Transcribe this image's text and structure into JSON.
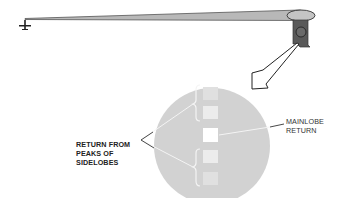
{
  "diagram": {
    "labels": {
      "sidelobe_return": "RETURN FROM\nPEAKS OF\nSIDELOBES",
      "mainlobe_return": "MAINLOBE\nRETURN"
    },
    "elements": {
      "aircraft": "aircraft-icon",
      "beam": "radar-mainlobe-beam",
      "target_cell": "ground-resolution-cell",
      "magnifier_arrow": "hollow-arrow",
      "scope": "circular-display"
    },
    "returns": [
      {
        "kind": "sidelobe",
        "intensity": "dim"
      },
      {
        "kind": "sidelobe",
        "intensity": "medium"
      },
      {
        "kind": "mainlobe",
        "intensity": "bright"
      },
      {
        "kind": "sidelobe",
        "intensity": "medium"
      },
      {
        "kind": "sidelobe",
        "intensity": "dim"
      }
    ],
    "colors": {
      "beam_fill": "#b8b8b8",
      "beam_edge": "#555555",
      "cell_dark": "#555555",
      "scope_fill": "#d2d2d2",
      "return_bright": "#ffffff",
      "return_medium": "#ececec",
      "return_dim": "#e0e0e0",
      "ink": "#222222"
    }
  }
}
